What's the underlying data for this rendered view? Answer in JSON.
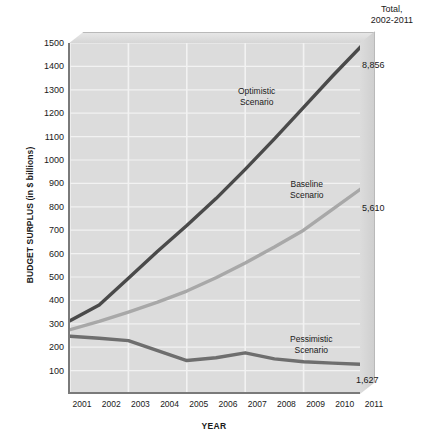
{
  "chart_data": {
    "type": "line",
    "title": "",
    "xlabel": "YEAR",
    "ylabel": "BUDGET SURPLUS (in $ billions)",
    "x": [
      2001,
      2002,
      2003,
      2004,
      2005,
      2006,
      2007,
      2008,
      2009,
      2010,
      2011
    ],
    "categories": [
      "2001",
      "2002",
      "2003",
      "2004",
      "2005",
      "2006",
      "2007",
      "2008",
      "2009",
      "2010",
      "2011"
    ],
    "xlim": [
      2001,
      2011
    ],
    "ylim": [
      0,
      1500
    ],
    "yticks": [
      1500,
      1400,
      1300,
      1200,
      1100,
      1000,
      900,
      800,
      700,
      600,
      500,
      400,
      300,
      200,
      100
    ],
    "grid": true,
    "legend_position": "inline-annotations",
    "series": [
      {
        "name": "Optimistic Scenario",
        "label": "Optimistic\nScenario",
        "label_line1": "Optimistic",
        "label_line2": "Scenario",
        "total_label": "8,856",
        "color": "#4a4a4a",
        "values": [
          313,
          380,
          495,
          610,
          720,
          835,
          960,
          1090,
          1225,
          1360,
          1490
        ]
      },
      {
        "name": "Baseline Scenario",
        "label_line1": "Baseline",
        "label_line2": "Scenario",
        "total_label": "5,610",
        "color": "#a8a8a8",
        "values": [
          275,
          310,
          350,
          393,
          440,
          497,
          560,
          628,
          700,
          790,
          880
        ]
      },
      {
        "name": "Pessimistic Scenario",
        "label_line1": "Pessimistic",
        "label_line2": "Scenario",
        "total_label": "1,627",
        "color": "#6e6e6e",
        "values": [
          247,
          238,
          228,
          185,
          143,
          155,
          176,
          150,
          138,
          132,
          127
        ]
      }
    ]
  },
  "header": {
    "total_line1": "Total,",
    "total_line2": "2002-2011"
  },
  "axes": {
    "y_title": "BUDGET SURPLUS (in $ billions)",
    "x_title": "YEAR"
  },
  "colors": {
    "plot_background": "#dcdcdc",
    "gridline": "#f2f2f2",
    "axis": "#7a7a7a",
    "optimistic": "#4a4a4a",
    "baseline": "#a8a8a8",
    "pessimistic": "#6e6e6e"
  }
}
